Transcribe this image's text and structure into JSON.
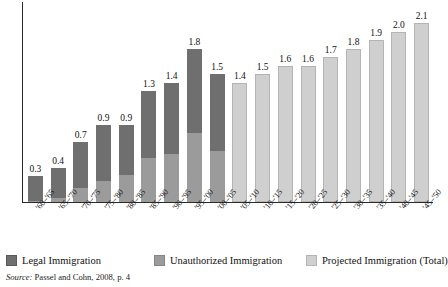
{
  "chart_data": {
    "type": "bar",
    "subtype": "stacked-bar",
    "title": "",
    "subtitle": "",
    "xlabel": "",
    "ylabel": "",
    "ylim": [
      0,
      2.35
    ],
    "grid": false,
    "legend_position": "bottom",
    "categories": [
      "'60–'65",
      "'65–'70",
      "'70–'75",
      "'75–'80",
      "'80–'85",
      "'85–'90",
      "'90–'95",
      "'95–'00",
      "'00–'05",
      "'05–'10",
      "'10–'15",
      "'15–'20",
      "'20–'25",
      "'25–'30",
      "'30–'35",
      "'35–'40",
      "'40–'45",
      "'45–'50"
    ],
    "totals": [
      0.3,
      0.4,
      0.7,
      0.9,
      0.9,
      1.3,
      1.4,
      1.8,
      1.5,
      1.4,
      1.5,
      1.6,
      1.6,
      1.7,
      1.8,
      1.9,
      2.0,
      2.1
    ],
    "total_labels": [
      "0.3",
      "0.4",
      "0.7",
      "0.9",
      "0.9",
      "1.3",
      "1.4",
      "1.8",
      "1.5",
      "1.4",
      "1.5",
      "1.6",
      "1.6",
      "1.7",
      "1.8",
      "1.9",
      "2.0",
      "2.1"
    ],
    "series": [
      {
        "name": "Legal Immigration",
        "color": "#6f6f6f",
        "values": [
          0.29,
          0.35,
          0.53,
          0.65,
          0.58,
          0.78,
          0.84,
          0.99,
          0.9,
          null,
          null,
          null,
          null,
          null,
          null,
          null,
          null,
          null
        ]
      },
      {
        "name": "Unauthorized Immigration",
        "color": "#9b9b9b",
        "values": [
          0.01,
          0.05,
          0.17,
          0.25,
          0.32,
          0.52,
          0.56,
          0.81,
          0.6,
          null,
          null,
          null,
          null,
          null,
          null,
          null,
          null,
          null
        ]
      },
      {
        "name": "Projected Immigration (Total)",
        "color": "#cfcfcf",
        "values": [
          null,
          null,
          null,
          null,
          null,
          null,
          null,
          null,
          null,
          1.4,
          1.5,
          1.6,
          1.6,
          1.7,
          1.8,
          1.9,
          2.0,
          2.1
        ]
      }
    ],
    "bars": [
      {
        "category": "'60–'65",
        "total": 0.3,
        "label": "0.3",
        "legal": 0.29,
        "unauthorized": 0.01,
        "projected": null
      },
      {
        "category": "'65–'70",
        "total": 0.4,
        "label": "0.4",
        "legal": 0.35,
        "unauthorized": 0.05,
        "projected": null
      },
      {
        "category": "'70–'75",
        "total": 0.7,
        "label": "0.7",
        "legal": 0.53,
        "unauthorized": 0.17,
        "projected": null
      },
      {
        "category": "'75–'80",
        "total": 0.9,
        "label": "0.9",
        "legal": 0.65,
        "unauthorized": 0.25,
        "projected": null
      },
      {
        "category": "'80–'85",
        "total": 0.9,
        "label": "0.9",
        "legal": 0.58,
        "unauthorized": 0.32,
        "projected": null
      },
      {
        "category": "'85–'90",
        "total": 1.3,
        "label": "1.3",
        "legal": 0.78,
        "unauthorized": 0.52,
        "projected": null
      },
      {
        "category": "'90–'95",
        "total": 1.4,
        "label": "1.4",
        "legal": 0.84,
        "unauthorized": 0.56,
        "projected": null
      },
      {
        "category": "'95–'00",
        "total": 1.8,
        "label": "1.8",
        "legal": 0.99,
        "unauthorized": 0.81,
        "projected": null
      },
      {
        "category": "'00–'05",
        "total": 1.5,
        "label": "1.5",
        "legal": 0.9,
        "unauthorized": 0.6,
        "projected": null
      },
      {
        "category": "'05–'10",
        "total": 1.4,
        "label": "1.4",
        "legal": null,
        "unauthorized": null,
        "projected": 1.4
      },
      {
        "category": "'10–'15",
        "total": 1.5,
        "label": "1.5",
        "legal": null,
        "unauthorized": null,
        "projected": 1.5
      },
      {
        "category": "'15–'20",
        "total": 1.6,
        "label": "1.6",
        "legal": null,
        "unauthorized": null,
        "projected": 1.6
      },
      {
        "category": "'20–'25",
        "total": 1.6,
        "label": "1.6",
        "legal": null,
        "unauthorized": null,
        "projected": 1.6
      },
      {
        "category": "'25–'30",
        "total": 1.7,
        "label": "1.7",
        "legal": null,
        "unauthorized": null,
        "projected": 1.7
      },
      {
        "category": "'30–'35",
        "total": 1.8,
        "label": "1.8",
        "legal": null,
        "unauthorized": null,
        "projected": 1.8
      },
      {
        "category": "'35–'40",
        "total": 1.9,
        "label": "1.9",
        "legal": null,
        "unauthorized": null,
        "projected": 1.9
      },
      {
        "category": "'40–'45",
        "total": 2.0,
        "label": "2.0",
        "legal": null,
        "unauthorized": null,
        "projected": 2.0
      },
      {
        "category": "'45–'50",
        "total": 2.1,
        "label": "2.1",
        "legal": null,
        "unauthorized": null,
        "projected": 2.1
      }
    ]
  },
  "legend": {
    "items": [
      {
        "label": "Legal Immigration",
        "color": "#6f6f6f",
        "swatch_class": "sw-legal"
      },
      {
        "label": "Unauthorized Immigration",
        "color": "#9b9b9b",
        "swatch_class": "sw-unauth"
      },
      {
        "label": "Projected Immigration (Total)",
        "color": "#cfcfcf",
        "swatch_class": "sw-proj"
      }
    ]
  },
  "source": {
    "prefix": "Source:",
    "text": " Passel and Cohn, 2008, p. 4"
  },
  "colors": {
    "legal": "#6f6f6f",
    "unauthorized": "#9b9b9b",
    "projected": "#cfcfcf",
    "axis": "#2b2b2b",
    "background": "#ffffff",
    "text": "#111111"
  }
}
